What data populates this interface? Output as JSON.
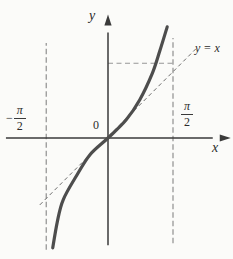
{
  "labels": {
    "y_axis": "y",
    "x_axis": "x",
    "origin": "0",
    "identity_line": "y = x",
    "minus_sign": "−",
    "pi": "π",
    "two": "2"
  },
  "chart_data": {
    "type": "line",
    "xlabel": "x",
    "ylabel": "y",
    "x_tick_labels": [
      "−π/2",
      "0",
      "π/2"
    ],
    "axis_unit": "π/2",
    "x_range_units": [
      -1.57,
      1.75
    ],
    "y_range_units": [
      -1.65,
      1.76
    ],
    "grid": false,
    "legend": "none",
    "series": [
      {
        "name": "y = tan x",
        "style": "thick-solid",
        "points_units": [
          [
            -0.85,
            -1.69
          ],
          [
            -0.78,
            -1.29
          ],
          [
            -0.69,
            -0.95
          ],
          [
            -0.49,
            -0.59
          ],
          [
            -0.28,
            -0.26
          ],
          [
            0,
            0
          ],
          [
            0.28,
            0.28
          ],
          [
            0.49,
            0.59
          ],
          [
            0.68,
            0.99
          ],
          [
            0.8,
            1.35
          ],
          [
            0.91,
            1.71
          ]
        ]
      },
      {
        "name": "y = x",
        "style": "thin-dashed",
        "points_units": [
          [
            -1.05,
            -1.03
          ],
          [
            1.35,
            1.37
          ]
        ]
      }
    ],
    "asymptotes": [
      {
        "name": "x = −π/2",
        "x_units": -0.95,
        "y_span_units": [
          -1.72,
          1.46
        ]
      },
      {
        "name": "x = π/2",
        "x_units": 1.0,
        "y_span_units": [
          -1.62,
          1.54
        ]
      }
    ],
    "helper_lines": [
      {
        "name": "y = π/2 level",
        "style": "dashed",
        "points_units": [
          [
            0,
            1.15
          ],
          [
            1.0,
            1.15
          ]
        ]
      }
    ],
    "colors": {
      "curve": "#4d4d4d",
      "axis": "#3a3a3a",
      "dashed": "#979797",
      "identity_dashed": "#6e6e6e",
      "background": "#fbfbf9",
      "text": "#2b2b2b"
    }
  }
}
